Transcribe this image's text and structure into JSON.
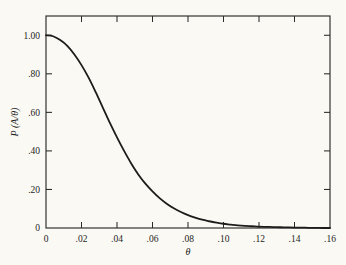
{
  "chart_data": {
    "type": "line",
    "title": "",
    "subtitle": "",
    "xlabel": "θ",
    "ylabel": "P (A/θ)",
    "xlim": [
      0,
      0.16
    ],
    "ylim": [
      0,
      1.1
    ],
    "grid": false,
    "legend": "none",
    "legend_position": "none",
    "curve_color": "#1c1c1a",
    "axis_color": "#2a2a28",
    "background_color": "#faf9f4",
    "x_ticks": [
      0,
      0.02,
      0.04,
      0.06,
      0.08,
      0.1,
      0.12,
      0.14,
      0.16
    ],
    "x_tick_labels": [
      "0",
      ".02",
      ".04",
      ".06",
      ".08",
      ".10",
      ".12",
      ".14",
      ".16"
    ],
    "y_ticks": [
      0,
      0.2,
      0.4,
      0.6,
      0.8,
      1.0
    ],
    "y_tick_labels": [
      "0",
      ".20",
      ".40",
      ".60",
      ".80",
      "1.00"
    ],
    "ticks_inward": true,
    "ticks_all_four_sides": true,
    "series": [
      {
        "name": "P (A/θ)",
        "x": [
          0.0,
          0.004,
          0.008,
          0.012,
          0.016,
          0.02,
          0.024,
          0.028,
          0.032,
          0.036,
          0.04,
          0.044,
          0.048,
          0.052,
          0.056,
          0.06,
          0.064,
          0.068,
          0.072,
          0.076,
          0.08,
          0.084,
          0.088,
          0.092,
          0.096,
          0.1,
          0.104,
          0.108,
          0.112,
          0.116,
          0.12,
          0.124,
          0.128,
          0.132,
          0.136,
          0.14,
          0.144,
          0.148,
          0.152,
          0.156,
          0.16
        ],
        "y": [
          1.0,
          0.995,
          0.975,
          0.945,
          0.9,
          0.845,
          0.78,
          0.705,
          0.625,
          0.545,
          0.47,
          0.4,
          0.335,
          0.278,
          0.23,
          0.19,
          0.155,
          0.126,
          0.102,
          0.083,
          0.067,
          0.054,
          0.043,
          0.035,
          0.028,
          0.022,
          0.018,
          0.014,
          0.011,
          0.009,
          0.007,
          0.006,
          0.005,
          0.004,
          0.003,
          0.002,
          0.002,
          0.001,
          0.001,
          0.0,
          0.0
        ]
      }
    ]
  },
  "figure": {
    "plot_left": 46,
    "plot_right": 330,
    "plot_top": 16,
    "plot_bottom": 228
  }
}
